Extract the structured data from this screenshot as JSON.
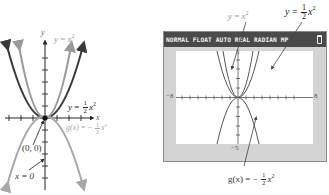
{
  "left_graph": {
    "axis_labels": {
      "x": "x",
      "y": "y"
    },
    "labels": {
      "y_eq_x2": {
        "lhs": "y",
        "eq": "=",
        "rhs": "x",
        "exp": "2"
      },
      "y_eq_half_x2": {
        "lhs": "y",
        "eq": "=",
        "num": "1",
        "den": "2",
        "rhs": "x",
        "exp": "2"
      },
      "g_eq_neg_half_x2": {
        "lhs": "g(x)",
        "eq": "= −",
        "num": "1",
        "den": "2",
        "rhs": "x",
        "exp": "2"
      },
      "vertex": "(0, 0)",
      "axis_of_symmetry": "x = 0"
    },
    "colors": {
      "y_x2": "#9a9a9a",
      "y_half_x2": "#3a3a3a",
      "g": "#a8a8a8",
      "axis": "#222222"
    }
  },
  "calculator": {
    "status_bar": "NORMAL FLOAT AUTO REAL RADIAN MP",
    "battery_icon": "battery-icon",
    "window": {
      "xmin": "−8",
      "xmax": "8",
      "ymax": "5",
      "ymin": "−5"
    },
    "labels": {
      "y_eq_x2": {
        "lhs": "y",
        "eq": "=",
        "rhs": "x",
        "exp": "2"
      },
      "y_eq_half_x2": {
        "lhs": "y",
        "eq": "=",
        "num": "1",
        "den": "2",
        "rhs": "x",
        "exp": "2"
      },
      "g_eq_neg_half_x2": {
        "lhs": "g(x)",
        "eq": "= −",
        "num": "1",
        "den": "2",
        "rhs": "x",
        "exp": "2"
      }
    },
    "colors": {
      "header_bg": "#4a4a4a",
      "frame": "#d4d4d4",
      "plot_bg": "#ffffff",
      "curve": "#555555"
    }
  }
}
